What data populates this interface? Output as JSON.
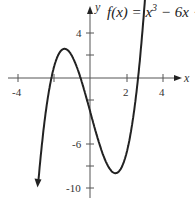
{
  "chart_data": {
    "type": "line",
    "function": "x^3 - 6x - 3",
    "xlabel": "x",
    "ylabel": "y",
    "x_ticks": [
      -4,
      2,
      4
    ],
    "y_ticks": [
      4,
      -6,
      -10
    ],
    "xlim": [
      -4.5,
      4.8
    ],
    "ylim": [
      -11,
      7
    ],
    "grid": false,
    "points": [
      {
        "x": -2.9,
        "y": -10.0
      },
      {
        "x": -2.0,
        "y": 1.0
      },
      {
        "x": -1.414,
        "y": 2.66
      },
      {
        "x": 0,
        "y": -3.0
      },
      {
        "x": 1.414,
        "y": -8.66
      },
      {
        "x": 2.0,
        "y": -7.0
      },
      {
        "x": 3.3,
        "y": 13.2
      }
    ]
  },
  "labels": {
    "title_prefix": "f(x) = x",
    "title_exp": "3",
    "title_suffix": " − 6x −",
    "x_axis": "x",
    "y_axis": "y",
    "tick_x_neg4": "-4",
    "tick_x_2": "2",
    "tick_x_4": "4",
    "tick_y_4": "4",
    "tick_y_neg6": "-6",
    "tick_y_neg10": "-10"
  }
}
